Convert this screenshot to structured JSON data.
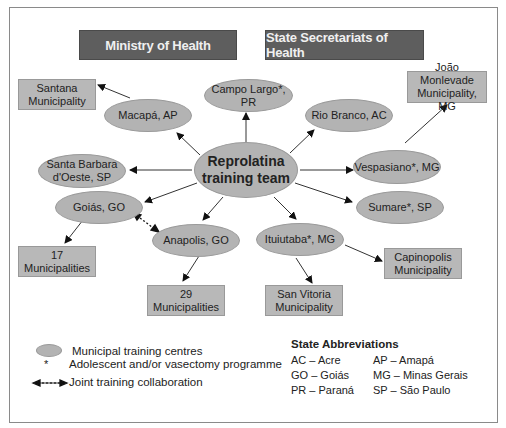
{
  "header": {
    "ministry": "Ministry of Health",
    "state": "State Secretariats of Health"
  },
  "center": {
    "line1": "Reprolatina",
    "line2": "training team"
  },
  "centres": {
    "campo_largo": "Campo Largo*, PR",
    "macapa": "Macapá, AP",
    "rio_branco": "Rio Branco, AC",
    "santa_barbara_1": "Santa Barbara",
    "santa_barbara_2": "d'Oeste, SP",
    "vespasiano": "Vespasiano*, MG",
    "goias": "Goiás, GO",
    "sumare": "Sumare*, SP",
    "anapolis": "Anapolis, GO",
    "ituiutaba": "Ituiutaba*, MG"
  },
  "municipalities": {
    "santana_1": "Santana",
    "santana_2": "Municipality",
    "joao_1": "João Monlevade",
    "joao_2": "Municipality, MG",
    "m17_1": "17",
    "m17_2": "Municipalities",
    "m29_1": "29",
    "m29_2": "Municipalities",
    "san_vitoria_1": "San Vitoria",
    "san_vitoria_2": "Municipality",
    "capinopolis_1": "Capinopolis",
    "capinopolis_2": "Municipality"
  },
  "legend": {
    "centres": "Municipal training centres",
    "asterisk_symbol": "*",
    "asterisk": "Adolescent and/or vasectomy programme",
    "joint": "Joint training collaboration"
  },
  "abbreviations": {
    "title": "State Abbreviations",
    "items": [
      "AC – Acre",
      "AP – Amapá",
      "GO – Goiás",
      "MG – Minas Gerais",
      "PR – Paraná",
      "SP – São Paulo"
    ]
  },
  "colors": {
    "header_bg": "#5e5e5e",
    "node_fill": "#b3b3b3",
    "box_fill": "#b8b8b8"
  }
}
